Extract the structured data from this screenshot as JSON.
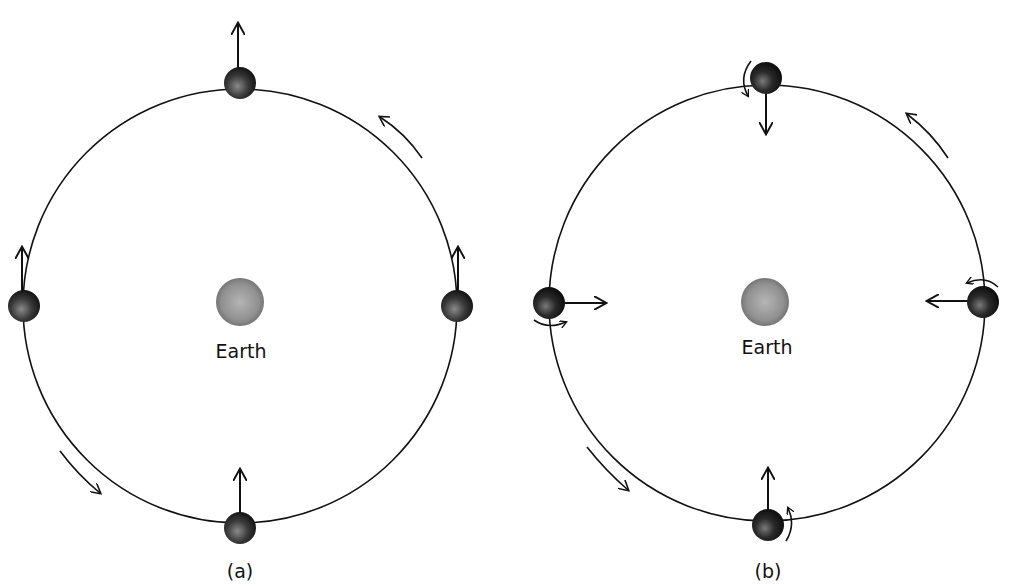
{
  "figure": {
    "colors": {
      "line": "#111111",
      "moon_dark": "#1a1a1a",
      "moon_light": "#8a8a8a",
      "earth_dark": "#6e6e6e",
      "earth_light": "#b8b8b8",
      "background": "#ffffff"
    }
  },
  "panels": [
    {
      "id": "a",
      "caption": "(a)",
      "center_label": "Earth",
      "orbit": {
        "cx": 240,
        "cy": 306,
        "r": 217
      },
      "earth": {
        "cx": 240,
        "cy": 302,
        "r": 24
      },
      "orbit_direction": "counterclockwise",
      "moons": [
        {
          "position": "top",
          "cx": 240,
          "cy": 83,
          "arrow": "up",
          "rotation_arrow": false
        },
        {
          "position": "left",
          "cx": 24,
          "cy": 306,
          "arrow": "up",
          "rotation_arrow": false
        },
        {
          "position": "right",
          "cx": 457,
          "cy": 306,
          "arrow": "up",
          "rotation_arrow": false
        },
        {
          "position": "bottom",
          "cx": 240,
          "cy": 528,
          "arrow": "up",
          "rotation_arrow": false
        }
      ]
    },
    {
      "id": "b",
      "caption": "(b)",
      "center_label": "Earth",
      "orbit": {
        "cx": 767,
        "cy": 303,
        "r": 218
      },
      "earth": {
        "cx": 765,
        "cy": 302,
        "r": 24
      },
      "orbit_direction": "counterclockwise",
      "moons": [
        {
          "position": "top",
          "cx": 766,
          "cy": 78,
          "arrow": "down",
          "rotation_arrow": true
        },
        {
          "position": "left",
          "cx": 549,
          "cy": 303,
          "arrow": "right",
          "rotation_arrow": true
        },
        {
          "position": "right",
          "cx": 983,
          "cy": 302,
          "arrow": "left",
          "rotation_arrow": true
        },
        {
          "position": "bottom",
          "cx": 768,
          "cy": 525,
          "arrow": "up",
          "rotation_arrow": true
        }
      ]
    }
  ]
}
